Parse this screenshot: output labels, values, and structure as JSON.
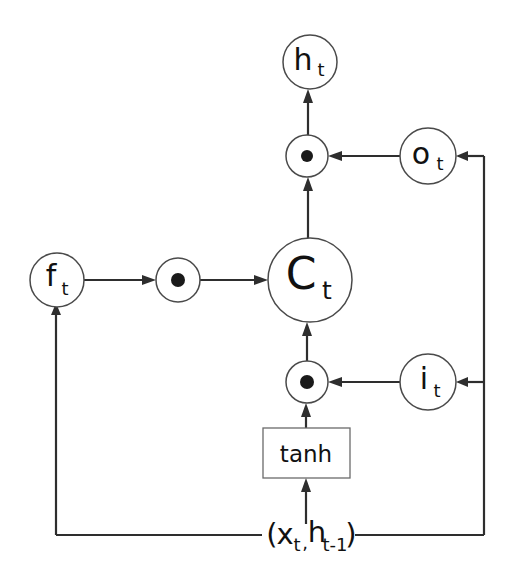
{
  "figure": {
    "background_color": "#ffffff",
    "wire_color": "#2e2e2e",
    "node_stroke_color": "#4a4a4a",
    "dot_color": "#1a1a1a",
    "text_color": "#111111"
  },
  "nodes": {
    "hidden_output": {
      "name": "h_t",
      "base": "h",
      "sub": "t",
      "cx": 310,
      "cy": 62,
      "r": 27
    },
    "output_gate": {
      "name": "o_t",
      "base": "o",
      "sub": "t",
      "cx": 428,
      "cy": 156,
      "r": 28
    },
    "forget_gate": {
      "name": "f_t",
      "base": "f",
      "sub": "t",
      "cx": 57,
      "cy": 280,
      "r": 27
    },
    "cell_state": {
      "name": "C_t",
      "base": "C",
      "sub": "t",
      "cx": 310,
      "cy": 280,
      "r": 42
    },
    "input_gate": {
      "name": "i_t",
      "base": "i",
      "sub": "t",
      "cx": 428,
      "cy": 382,
      "r": 28
    }
  },
  "operators": [
    {
      "name": "multiply-output",
      "symbol": "dot-product",
      "cx": 307,
      "cy": 156,
      "r": 21,
      "dot_r": 6
    },
    {
      "name": "multiply-forget",
      "symbol": "dot-product",
      "cx": 178,
      "cy": 280,
      "r": 22,
      "dot_r": 7
    },
    {
      "name": "multiply-input",
      "symbol": "dot-product",
      "cx": 307,
      "cy": 382,
      "r": 21,
      "dot_r": 7
    }
  ],
  "gate_box": {
    "label": "tanh",
    "x": 263,
    "y": 428,
    "width": 87,
    "height": 50,
    "cx": 306,
    "cy": 453
  },
  "input_label": {
    "open_paren": "(",
    "x_base": "x",
    "x_sub": "t",
    "comma": ",",
    "h_base": "h",
    "h_sub": "t-1",
    "close_paren": ")",
    "full_text": "(xt,ht-1)",
    "cx": 307,
    "cy": 537
  },
  "wires": {
    "left_bus_x": 56,
    "right_bus_x": 484,
    "bottom_bus_y": 535,
    "label_left_edge": 262,
    "label_right_edge": 355
  },
  "connections": [
    {
      "name": "multiply-output-to-hidden",
      "from": "multiply-output",
      "to": "hidden_output"
    },
    {
      "name": "output-gate-to-multiply",
      "from": "output_gate",
      "to": "multiply-output"
    },
    {
      "name": "cell-state-to-multiply",
      "from": "cell_state",
      "to": "multiply-output"
    },
    {
      "name": "forget-gate-to-multiply",
      "from": "forget_gate",
      "to": "multiply-forget"
    },
    {
      "name": "multiply-forget-to-cell",
      "from": "multiply-forget",
      "to": "cell_state"
    },
    {
      "name": "multiply-input-to-cell",
      "from": "multiply-input",
      "to": "cell_state"
    },
    {
      "name": "input-gate-to-multiply",
      "from": "input_gate",
      "to": "multiply-input"
    },
    {
      "name": "tanh-to-multiply",
      "from": "gate_box",
      "to": "multiply-input"
    },
    {
      "name": "input-to-tanh",
      "from": "input_label",
      "to": "gate_box"
    },
    {
      "name": "input-to-forget-gate",
      "from": "input_label",
      "to": "forget_gate"
    },
    {
      "name": "input-to-input-gate",
      "from": "input_label",
      "to": "input_gate"
    },
    {
      "name": "input-to-output-gate",
      "from": "input_label",
      "to": "output_gate"
    }
  ]
}
